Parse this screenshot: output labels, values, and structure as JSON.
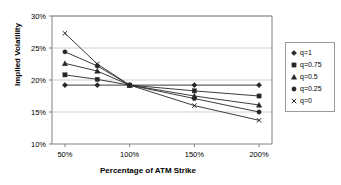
{
  "chart_data": {
    "type": "line",
    "title": "",
    "xlabel": "Percentage of ATM Strike",
    "ylabel": "Implied Volatility",
    "x": [
      50,
      75,
      100,
      150,
      200
    ],
    "x_tick_labels": [
      "50%",
      "100%",
      "150%",
      "200%"
    ],
    "x_ticks": [
      50,
      100,
      150,
      200
    ],
    "xlim": [
      40,
      210
    ],
    "y_tick_labels": [
      "10%",
      "15%",
      "20%",
      "25%",
      "30%"
    ],
    "y_ticks": [
      10,
      15,
      20,
      25,
      30
    ],
    "ylim": [
      10,
      30
    ],
    "grid": true,
    "legend_position": "right",
    "series": [
      {
        "name": "q=1",
        "marker": "diamond",
        "values": [
          19.2,
          19.2,
          19.2,
          19.2,
          19.2
        ]
      },
      {
        "name": "q=0.75",
        "marker": "square",
        "values": [
          20.8,
          20.1,
          19.2,
          18.3,
          17.5
        ]
      },
      {
        "name": "q=0.5",
        "marker": "triangle",
        "values": [
          22.6,
          21.4,
          19.2,
          17.5,
          16.1
        ]
      },
      {
        "name": "q=0.25",
        "marker": "circle",
        "values": [
          24.4,
          22.2,
          19.2,
          17.1,
          15.0
        ]
      },
      {
        "name": "q=0",
        "marker": "x",
        "values": [
          27.3,
          22.5,
          19.2,
          16.0,
          13.7
        ]
      }
    ]
  },
  "axis": {
    "x_title": "Percentage of ATM Strike",
    "y_title": "Implied Volatility"
  },
  "legend": {
    "items": [
      {
        "label": "q=1",
        "marker": "diamond-marker"
      },
      {
        "label": "q=0.75",
        "marker": "square-marker"
      },
      {
        "label": "q=0.5",
        "marker": "triangle-marker"
      },
      {
        "label": "q=0.25",
        "marker": "circle-marker"
      },
      {
        "label": "q=0",
        "marker": "x-marker"
      }
    ]
  },
  "colors": {
    "line": "#262626",
    "axis": "#808080",
    "grid": "#d0d0d0",
    "text": "#000000",
    "background": "#ffffff"
  }
}
